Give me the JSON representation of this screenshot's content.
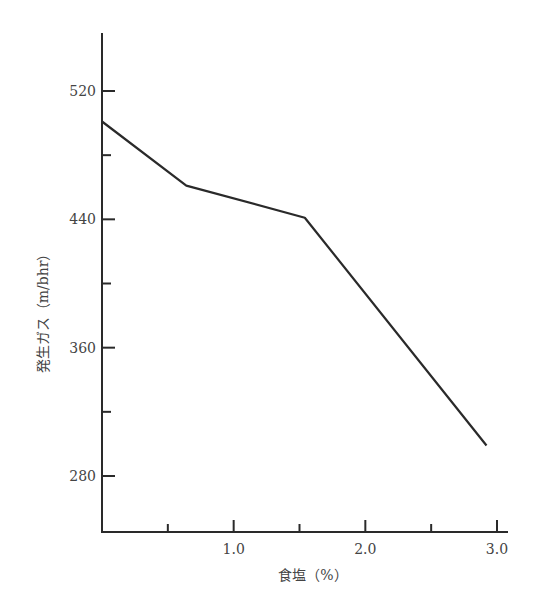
{
  "chart_data": {
    "type": "line",
    "title": "",
    "xlabel": "食塩（%）",
    "ylabel": "発生ガス（m/bhr）",
    "xlim": [
      0,
      3.05
    ],
    "ylim": [
      250,
      565
    ],
    "x_ticks": [
      0.5,
      1.0,
      1.5,
      2.0,
      2.5,
      3.0
    ],
    "x_tick_labels": [
      "",
      "1.0",
      "",
      "2.0",
      "",
      "3.0"
    ],
    "y_ticks": [
      280,
      320,
      360,
      400,
      440,
      480,
      520
    ],
    "y_tick_labels": [
      "280",
      "",
      "360",
      "",
      "440",
      "",
      "520"
    ],
    "grid": false,
    "legend": null,
    "series": [
      {
        "name": "発生ガス",
        "x": [
          0.0,
          0.64,
          1.54,
          2.92
        ],
        "values": [
          501,
          461,
          441,
          299
        ],
        "color": "#2a2a2a"
      }
    ]
  }
}
